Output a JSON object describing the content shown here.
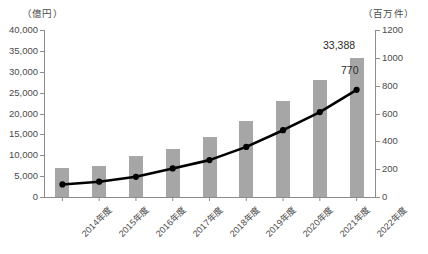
{
  "chart_data": {
    "type": "bar",
    "title": "",
    "subtitle": "",
    "xlabel": "",
    "categories": [
      "2014年度",
      "2015年度",
      "2016年度",
      "2017年度",
      "2018年度",
      "2019年度",
      "2020年度",
      "2021年度",
      "2022年度"
    ],
    "grid": false,
    "legend": "none",
    "axes": {
      "left": {
        "unit_label": "（億円）",
        "ylabel": "億円",
        "ylim": [
          0,
          40000
        ],
        "tick_step": 5000,
        "ticks": [
          0,
          5000,
          10000,
          15000,
          20000,
          25000,
          30000,
          35000,
          40000
        ],
        "tick_labels": [
          "0",
          "5,000",
          "10,000",
          "15,000",
          "20,000",
          "25,000",
          "30,000",
          "35,000",
          "40,000"
        ]
      },
      "right": {
        "unit_label": "（百万件）",
        "ylabel": "百万件",
        "ylim": [
          0,
          1200
        ],
        "tick_step": 200,
        "ticks": [
          0,
          200,
          400,
          600,
          800,
          1000,
          1200
        ],
        "tick_labels": [
          "0",
          "200",
          "400",
          "600",
          "800",
          "1000",
          "1200"
        ]
      }
    },
    "series": [
      {
        "name": "金額",
        "type": "bar",
        "axis": "left",
        "color": "#a6a6a6",
        "values": [
          7000,
          7500,
          9800,
          11500,
          14300,
          18200,
          23000,
          28000,
          33388
        ],
        "data_labels": [
          "",
          "",
          "",
          "",
          "",
          "",
          "",
          "",
          "33,388"
        ]
      },
      {
        "name": "件数",
        "type": "line",
        "axis": "right",
        "color": "#000000",
        "marker": "circle",
        "values": [
          90,
          110,
          145,
          205,
          265,
          360,
          480,
          610,
          770
        ],
        "data_labels": [
          "",
          "",
          "",
          "",
          "",
          "",
          "",
          "",
          "770"
        ]
      }
    ]
  },
  "annotations": {
    "bar_last_label": "33,388",
    "line_last_label": "770"
  },
  "colors": {
    "bar": "#a6a6a6",
    "line": "#000000",
    "axis": "#8c8c8c",
    "text": "#4a4a4a",
    "background": "#ffffff"
  }
}
